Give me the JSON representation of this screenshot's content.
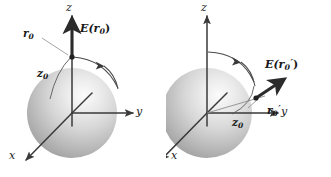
{
  "figure": {
    "type": "physics-diagram",
    "background_color": "#ffffff",
    "stroke_color": "#3a3a3a",
    "label_color": "#1a1a1a",
    "sphere_light_color": "#f2f2f2",
    "sphere_mid_color": "#c9c9c9",
    "sphere_dark_color": "#9a9a9a"
  },
  "panels": [
    {
      "id": "left",
      "name": "field-point-on-z-axis",
      "axes": [
        {
          "name": "z-axis",
          "label": "z",
          "direction": "up"
        },
        {
          "name": "y-axis",
          "label": "y",
          "direction": "right"
        },
        {
          "name": "x-axis",
          "label": "x",
          "direction": "down-left"
        }
      ],
      "labels": {
        "position_vector": "r",
        "position_vector_sub": "0",
        "position_vector_prime": "",
        "field_vector": "E(r",
        "field_vector_sub": "0",
        "field_vector_prime": "",
        "field_vector_close": ")",
        "height_label": "z",
        "height_label_sub": "0"
      },
      "annotations": {
        "rotation_arc": "curved arrow sweeping clockwise from the field point toward the y-axis",
        "field_point": "dot on the z-axis at height z0 above the sphere center",
        "field_arrow": "bold arrow pointing straight up along +z from the field point",
        "leader_line": "thin leader from r0 label to the field point"
      }
    },
    {
      "id": "right",
      "name": "field-point-rotated-toward-y-axis",
      "axes": [
        {
          "name": "z-axis",
          "label": "z",
          "direction": "up"
        },
        {
          "name": "y-axis",
          "label": "y",
          "direction": "right"
        },
        {
          "name": "x-axis",
          "label": "x",
          "direction": "down-left"
        }
      ],
      "labels": {
        "position_vector": "r",
        "position_vector_sub": "0",
        "position_vector_prime": "′",
        "field_vector": "E(r",
        "field_vector_sub": "0",
        "field_vector_prime": "′",
        "field_vector_close": ")",
        "height_label": "z",
        "height_label_sub": "0"
      },
      "annotations": {
        "rotation_arc": "curved arrow sweeping clockwise from the z-axis down toward the rotated field point",
        "field_point": "dot on the rotated radius at distance z0 from the sphere center",
        "field_arrow": "bold arrow pointing radially outward up-and-right from the rotated field point",
        "leader_line": "thin leader from r0-prime label to the rotated field point"
      }
    }
  ]
}
